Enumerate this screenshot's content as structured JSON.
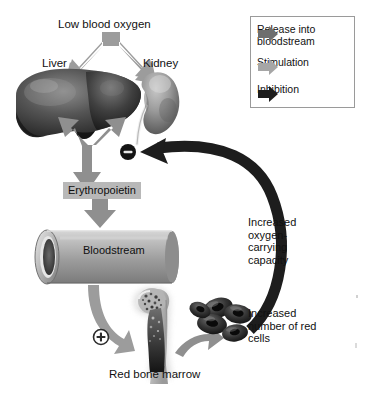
{
  "diagram": {
    "background_color": "#ffffff",
    "colors": {
      "stimulation_arrow": "#9c9c9c",
      "release_arrow": "#6e6e6e",
      "inhibition_arrow": "#1d1d1d",
      "label_highlight": "#b8b8b8",
      "legend_border": "#9a9a9a",
      "text": "#111111"
    },
    "labels": {
      "low_blood_oxygen": "Low blood oxygen",
      "liver": "Liver",
      "kidney": "Kidney",
      "erythropoietin": "Erythropoietin",
      "bloodstream": "Bloodstream",
      "red_bone_marrow": "Red bone marrow",
      "increased_oxygen_capacity": "Increased oxygen-carrying capacity",
      "increased_red_cells": "Increased number of red cells"
    },
    "signs": {
      "inhibition": "−",
      "stimulation": "+"
    },
    "legend": {
      "items": [
        {
          "label": "Release into bloodstream",
          "arrow": "release-arrow-icon",
          "color": "#6e6e6e"
        },
        {
          "label": "Stimulation",
          "arrow": "stimulation-arrow-icon",
          "color": "#9c9c9c"
        },
        {
          "label": "Inhibition",
          "arrow": "inhibition-arrow-icon",
          "color": "#1d1d1d"
        }
      ]
    },
    "structures": [
      {
        "name": "liver",
        "type": "organ-illustration"
      },
      {
        "name": "kidney",
        "type": "organ-illustration"
      },
      {
        "name": "bloodstream-vessel",
        "type": "cylinder-illustration"
      },
      {
        "name": "femur-bone-marrow",
        "type": "bone-illustration"
      },
      {
        "name": "red-blood-cells",
        "type": "cell-cluster-illustration"
      }
    ]
  }
}
